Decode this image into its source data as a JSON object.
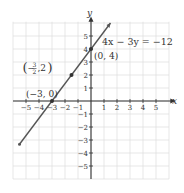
{
  "chart_data": {
    "type": "line",
    "title": "",
    "equation": "4x − 3y = −12",
    "xlabel": "x",
    "ylabel": "y",
    "xlim": [
      -5,
      5
    ],
    "ylim": [
      -5,
      5
    ],
    "grid": true,
    "x_ticks": [
      "−5",
      "−4",
      "−3",
      "−2",
      "−1",
      "1",
      "2",
      "3",
      "4",
      "5"
    ],
    "y_ticks": [
      "5",
      "4",
      "3",
      "2",
      "1",
      "−1",
      "−2",
      "−3",
      "−4",
      "−5"
    ],
    "series": [
      {
        "name": "4x − 3y = −12",
        "points": [
          [
            -5.5,
            -3.33
          ],
          [
            1.5,
            6
          ]
        ],
        "color": "#555555"
      }
    ],
    "labeled_points": [
      {
        "label": "(−3, 0)",
        "x": -3,
        "y": 0
      },
      {
        "label_prefix": "(−",
        "frac_num": "3",
        "frac_den": "2",
        "label_suffix": ", 2)",
        "x": -1.5,
        "y": 2
      },
      {
        "label": "(0, 4)",
        "x": 0,
        "y": 4
      }
    ]
  }
}
